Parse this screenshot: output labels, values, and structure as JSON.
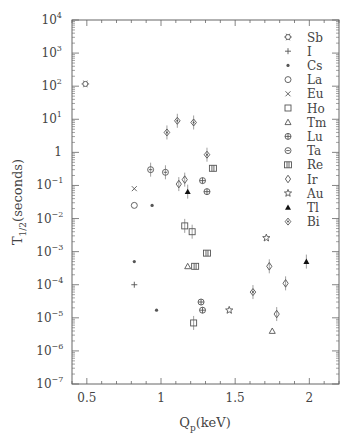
{
  "chart_data": {
    "type": "scatter",
    "title": "",
    "xlabel": "Q_p(keV)",
    "xlabel_main": "Q",
    "xlabel_sub": "p",
    "xlabel_unit": "(keV)",
    "ylabel": "T_1/2(seconds)",
    "ylabel_main": "T",
    "ylabel_sub": "1/2",
    "ylabel_unit": "(seconds)",
    "xlim": [
      0.4,
      2.2
    ],
    "ylim": [
      1e-07,
      10000.0
    ],
    "yscale": "log",
    "x_ticks": [
      0.5,
      1,
      1.5,
      2
    ],
    "x_tick_labels": [
      "0.5",
      "1",
      "1.5",
      "2"
    ],
    "y_ticks_exp": [
      4,
      3,
      2,
      1,
      0,
      -1,
      -2,
      -3,
      -4,
      -5,
      -6,
      -7
    ],
    "y_tick_labels": [
      "10^4",
      "10^3",
      "10^2",
      "10^1",
      "1",
      "10^-1",
      "10^-2",
      "10^-3",
      "10^-4",
      "10^-5",
      "10^-6",
      "10^-7"
    ],
    "grid": false,
    "legend_position": "upper right",
    "series": [
      {
        "name": "Sb",
        "marker": "asterisk-open",
        "points": [
          [
            0.49,
            117
          ]
        ]
      },
      {
        "name": "I",
        "marker": "plus",
        "points": [
          [
            0.82,
            0.0001
          ]
        ]
      },
      {
        "name": "Cs",
        "marker": "star-small",
        "points": [
          [
            0.82,
            0.0005
          ],
          [
            0.94,
            0.025
          ],
          [
            0.97,
            1.7e-05
          ]
        ]
      },
      {
        "name": "La",
        "marker": "circle",
        "points": [
          [
            0.82,
            0.025
          ]
        ]
      },
      {
        "name": "Eu",
        "marker": "cross",
        "points": [
          [
            0.82,
            0.08
          ]
        ]
      },
      {
        "name": "Ho",
        "marker": "square",
        "points": [
          [
            1.16,
            0.006
          ],
          [
            1.21,
            0.004
          ],
          [
            1.22,
            7e-06
          ]
        ]
      },
      {
        "name": "Tm",
        "marker": "triangle",
        "points": [
          [
            1.18,
            0.00036
          ],
          [
            1.75,
            4e-06
          ]
        ]
      },
      {
        "name": "Lu",
        "marker": "circle-cross",
        "points": [
          [
            1.27,
            3e-05
          ],
          [
            1.28,
            1.7e-05
          ],
          [
            1.28,
            0.14
          ],
          [
            1.31,
            0.065
          ]
        ]
      },
      {
        "name": "Ta",
        "marker": "circle-dash",
        "points": [
          [
            0.93,
            0.3
          ],
          [
            1.03,
            0.25
          ]
        ]
      },
      {
        "name": "Re",
        "marker": "double-square",
        "points": [
          [
            1.23,
            0.00036
          ],
          [
            1.31,
            0.0009
          ],
          [
            1.35,
            0.33
          ]
        ]
      },
      {
        "name": "Ir",
        "marker": "diamond",
        "points": [
          [
            1.12,
            0.11
          ],
          [
            1.16,
            0.15
          ],
          [
            1.73,
            0.00036
          ],
          [
            1.84,
            0.00011
          ],
          [
            1.78,
            1.3e-05
          ]
        ]
      },
      {
        "name": "Au",
        "marker": "star-open",
        "points": [
          [
            1.71,
            0.0026
          ],
          [
            1.46,
            1.7e-05
          ]
        ]
      },
      {
        "name": "Tl",
        "marker": "triangle-filled",
        "points": [
          [
            1.18,
            0.065
          ],
          [
            1.98,
            0.0005
          ]
        ]
      },
      {
        "name": "Bi",
        "marker": "diamond-dot",
        "points": [
          [
            1.04,
            4
          ],
          [
            1.11,
            9
          ],
          [
            1.22,
            8
          ],
          [
            1.31,
            0.85
          ],
          [
            1.62,
            6e-05
          ]
        ]
      }
    ]
  },
  "legend": {
    "items": [
      {
        "label": "Sb",
        "symbol": "✡"
      },
      {
        "label": "I",
        "symbol": "+"
      },
      {
        "label": "Cs",
        "symbol": "*"
      },
      {
        "label": "La",
        "symbol": "○"
      },
      {
        "label": "Eu",
        "symbol": "×"
      },
      {
        "label": "Ho",
        "symbol": "□"
      },
      {
        "label": "Tm",
        "symbol": "△"
      },
      {
        "label": "Lu",
        "symbol": "⊕"
      },
      {
        "label": "Ta",
        "symbol": "⊖"
      },
      {
        "label": "Re",
        "symbol": "⌗"
      },
      {
        "label": "Ir",
        "symbol": "◇"
      },
      {
        "label": "Au",
        "symbol": "☆"
      },
      {
        "label": "Tl",
        "symbol": "▲"
      },
      {
        "label": "Bi",
        "symbol": "◈"
      }
    ]
  }
}
